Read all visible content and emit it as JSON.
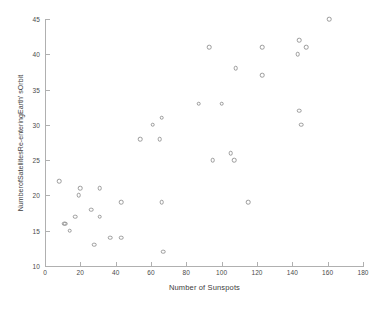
{
  "chart_data": {
    "type": "scatter",
    "title": "",
    "xlabel": "Number of Sunspots",
    "ylabel": "NumberofSatellitesRe-enteringEarth' sOrbit",
    "xlim": [
      0,
      180
    ],
    "ylim": [
      10,
      45
    ],
    "xticks": [
      0,
      20,
      40,
      60,
      80,
      100,
      120,
      140,
      160,
      180
    ],
    "yticks": [
      10,
      15,
      20,
      25,
      30,
      35,
      40,
      45
    ],
    "grid": false,
    "legend": null,
    "marker": {
      "shape": "open-circle",
      "color": "#9a9a9a",
      "size": 4.6
    },
    "series": [
      {
        "name": "Satellite re-entries vs sunspots",
        "points": [
          [
            8,
            22
          ],
          [
            11,
            16
          ],
          [
            11.5,
            16
          ],
          [
            14,
            15
          ],
          [
            17,
            17
          ],
          [
            19,
            20
          ],
          [
            20,
            21
          ],
          [
            26,
            18
          ],
          [
            28,
            13
          ],
          [
            31,
            17
          ],
          [
            31,
            21
          ],
          [
            37,
            14
          ],
          [
            43,
            14
          ],
          [
            43,
            19
          ],
          [
            54,
            28
          ],
          [
            61,
            30
          ],
          [
            65,
            28
          ],
          [
            66,
            31
          ],
          [
            66,
            19
          ],
          [
            67,
            12
          ],
          [
            87,
            33
          ],
          [
            93,
            41
          ],
          [
            95,
            25
          ],
          [
            100,
            33
          ],
          [
            105,
            26
          ],
          [
            107,
            25
          ],
          [
            108,
            38
          ],
          [
            115,
            19
          ],
          [
            123,
            41
          ],
          [
            123,
            37
          ],
          [
            143,
            40
          ],
          [
            144,
            42
          ],
          [
            144,
            32
          ],
          [
            145,
            30
          ],
          [
            148,
            41
          ],
          [
            161,
            45
          ]
        ]
      }
    ]
  },
  "axis_colors": {
    "line": "#b0b0b0",
    "tick_text": "#4a4a4a",
    "label_text": "#3d3d3d"
  }
}
